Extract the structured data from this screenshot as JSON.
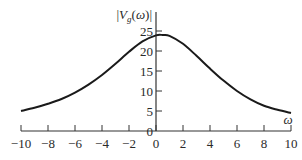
{
  "chart_data": {
    "type": "line",
    "title": "",
    "xlabel": "ω",
    "ylabel": "|V_g(ω)|",
    "xlim": [
      -10,
      10
    ],
    "ylim": [
      0,
      25
    ],
    "grid": false,
    "legend": null,
    "x_ticks": [
      -10,
      -8,
      -6,
      -4,
      -2,
      0,
      2,
      4,
      6,
      8,
      10
    ],
    "y_ticks": [
      0,
      5,
      10,
      15,
      20,
      25
    ],
    "series": [
      {
        "name": "|V_g(ω)|",
        "x": [
          -10,
          -9,
          -8,
          -7,
          -6,
          -5,
          -4,
          -3,
          -2,
          -1,
          0,
          0.5,
          1,
          2,
          3,
          4,
          5,
          6,
          7,
          8,
          9,
          10
        ],
        "y": [
          5,
          5.8,
          6.8,
          8,
          9.6,
          11.6,
          14,
          16.8,
          19.8,
          22.4,
          23.9,
          24,
          23.8,
          21.8,
          18.8,
          15.6,
          12.6,
          10,
          7.9,
          6.3,
          5.3,
          4.5
        ]
      }
    ]
  }
}
